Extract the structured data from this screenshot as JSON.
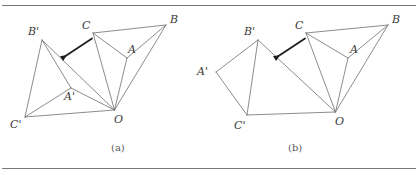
{
  "figure": {
    "background_color": "#ffffff",
    "stroke_color": "#6e6e6e",
    "arrow_color": "#1c1c1c",
    "rule_color": "#7a7a7a",
    "label_color": "#3a3a3a",
    "caption_color": "#5a5a5a",
    "rules": [
      {
        "name": "top-rule",
        "x1": 2,
        "y1": 5.5,
        "x2": 416,
        "y2": 5.5
      },
      {
        "name": "bottom-rule",
        "x1": 2,
        "y1": 168.5,
        "x2": 416,
        "y2": 168.5
      }
    ],
    "panels": [
      {
        "id": "panel-a",
        "caption": "(a)",
        "caption_x": 111,
        "caption_y": 143,
        "points": {
          "A": {
            "x": 127.0,
            "y": 58.0
          },
          "B": {
            "x": 166.0,
            "y": 25.0
          },
          "C": {
            "x": 93.0,
            "y": 33.0
          },
          "O": {
            "x": 114.5,
            "y": 110.0
          },
          "Ap": {
            "x": 71.0,
            "y": 88.0
          },
          "Bp": {
            "x": 42.0,
            "y": 40.0
          },
          "Cp": {
            "x": 25.0,
            "y": 117.0
          }
        },
        "edges": [
          [
            "C",
            "B"
          ],
          [
            "C",
            "A"
          ],
          [
            "C",
            "O"
          ],
          [
            "A",
            "B"
          ],
          [
            "A",
            "O"
          ],
          [
            "B",
            "O"
          ],
          [
            "Bp",
            "Cp"
          ],
          [
            "Bp",
            "Ap"
          ],
          [
            "Bp",
            "O"
          ],
          [
            "Ap",
            "Cp"
          ],
          [
            "Ap",
            "O"
          ],
          [
            "Cp",
            "O"
          ]
        ],
        "labels": [
          {
            "name": "label-A",
            "text": "A",
            "x": 128,
            "y": 44
          },
          {
            "name": "label-B",
            "text": "B",
            "x": 170,
            "y": 14
          },
          {
            "name": "label-C",
            "text": "C",
            "x": 82,
            "y": 20
          },
          {
            "name": "label-O",
            "text": "O",
            "x": 114,
            "y": 114
          },
          {
            "name": "label-Ap",
            "text": "A'",
            "x": 64,
            "y": 91
          },
          {
            "name": "label-Bp",
            "text": "B'",
            "x": 28,
            "y": 26
          },
          {
            "name": "label-Cp",
            "text": "C'",
            "x": 10,
            "y": 119
          }
        ],
        "arrow": {
          "x1": 92.0,
          "y1": 38.5,
          "x2": 67.0,
          "y2": 55.0
        }
      },
      {
        "id": "panel-b",
        "caption": "(b)",
        "caption_x": 288,
        "caption_y": 143,
        "points": {
          "A": {
            "x": 348.0,
            "y": 58.0
          },
          "B": {
            "x": 388.0,
            "y": 25.0
          },
          "C": {
            "x": 306.0,
            "y": 33.0
          },
          "O": {
            "x": 335.5,
            "y": 112.0
          },
          "Ap": {
            "x": 216.0,
            "y": 72.0
          },
          "Bp": {
            "x": 258.0,
            "y": 40.0
          },
          "Cp": {
            "x": 247.0,
            "y": 115.0
          }
        },
        "edges": [
          [
            "C",
            "B"
          ],
          [
            "C",
            "A"
          ],
          [
            "C",
            "O"
          ],
          [
            "A",
            "B"
          ],
          [
            "A",
            "O"
          ],
          [
            "B",
            "O"
          ],
          [
            "Bp",
            "Ap"
          ],
          [
            "Bp",
            "Cp"
          ],
          [
            "Bp",
            "O"
          ],
          [
            "Ap",
            "Cp"
          ],
          [
            "Cp",
            "O"
          ]
        ],
        "labels": [
          {
            "name": "label-A",
            "text": "A",
            "x": 350,
            "y": 44
          },
          {
            "name": "label-B",
            "text": "B",
            "x": 392,
            "y": 14
          },
          {
            "name": "label-C",
            "text": "C",
            "x": 295,
            "y": 20
          },
          {
            "name": "label-O",
            "text": "O",
            "x": 335,
            "y": 116
          },
          {
            "name": "label-Ap",
            "text": "A'",
            "x": 197,
            "y": 66
          },
          {
            "name": "label-Bp",
            "text": "B'",
            "x": 244,
            "y": 26
          },
          {
            "name": "label-Cp",
            "text": "C'",
            "x": 234,
            "y": 120
          }
        ],
        "arrow": {
          "x1": 305.0,
          "y1": 38.5,
          "x2": 280.0,
          "y2": 55.0
        }
      }
    ]
  }
}
